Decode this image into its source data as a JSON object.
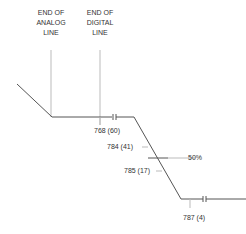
{
  "headers": {
    "analog": {
      "line1": "END OF",
      "line2": "ANALOG",
      "line3": "LINE"
    },
    "digital": {
      "line1": "END OF",
      "line2": "DIGITAL",
      "line3": "LINE"
    }
  },
  "markers": [
    {
      "label": "768  (60)"
    },
    {
      "label": "784  (41)"
    },
    {
      "label": "785  (17)"
    },
    {
      "label": "787  (4)"
    }
  ],
  "threshold": {
    "label": "50%"
  },
  "colors": {
    "line": "#333333",
    "guide": "#bbbbbb",
    "text": "#333333"
  }
}
